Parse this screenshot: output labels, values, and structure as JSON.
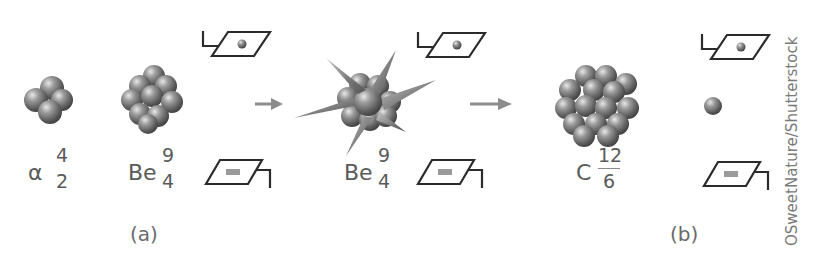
{
  "panels": {
    "a": {
      "caption": "(a)",
      "alpha": {
        "symbol": "α",
        "mass_number": "4",
        "atomic_number": "2"
      },
      "beryllium": {
        "symbol": "Be",
        "mass_number": "9",
        "atomic_number": "4"
      },
      "excited_beryllium": {
        "symbol": "Be",
        "mass_number": "9",
        "atomic_number": "4"
      },
      "carbon": {
        "symbol": "C",
        "mass_number": "12",
        "atomic_number": "6"
      }
    },
    "b": {
      "caption": "(b)"
    }
  },
  "credit": "OSweetNature/Shutterstock",
  "colors": {
    "nucleon": "#8a8a8a",
    "arrow": "#8c8c8c",
    "detector_outline": "#2b2b2b",
    "text": "#5a5a5a"
  },
  "icons": {
    "detector_top": "detector-with-particle-icon",
    "detector_bottom": "detector-with-bar-icon",
    "arrow": "right-arrow-icon",
    "neutron": "neutron-sphere-icon",
    "nucleus": "nucleus-cluster-icon",
    "excited_nucleus": "spiky-nucleus-icon"
  }
}
